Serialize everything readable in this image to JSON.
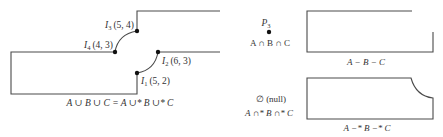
{
  "diagram": {
    "left_figure": {
      "points": [
        {
          "id": "I3",
          "name": "I",
          "sub": "3",
          "coords": "(5, 4)"
        },
        {
          "id": "I4",
          "name": "I",
          "sub": "4",
          "coords": "(4, 3)"
        },
        {
          "id": "I2",
          "name": "I",
          "sub": "2",
          "coords": "(6, 3)"
        },
        {
          "id": "I1",
          "name": "I",
          "sub": "1",
          "coords": "(5, 2)"
        }
      ],
      "caption": "A ∪ B ∪ C = A ∪* B ∪* C"
    },
    "intersection": {
      "point_label": "P",
      "point_sub": "3",
      "caption": "A ∩ B ∩ C"
    },
    "regularized_intersection": {
      "result": "∅ (null)",
      "caption": "A ∩* B ∩* C"
    },
    "difference": {
      "caption": "A − B − C"
    },
    "regularized_difference": {
      "caption": "A −* B −* C"
    },
    "colors": {
      "stroke": "#4a4a4a",
      "text": "#333333",
      "point": "#111111"
    }
  }
}
